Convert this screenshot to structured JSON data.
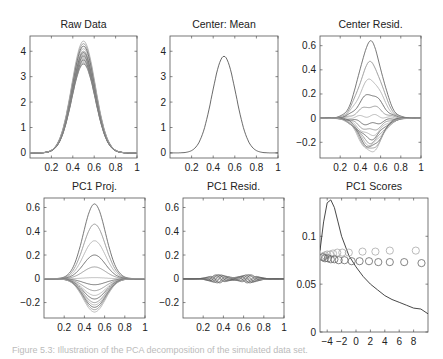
{
  "figure": {
    "caption": "Figure 5.3: Illustration of the PCA decomposition of the simulated data set."
  },
  "chart_data": [
    {
      "type": "line",
      "title": "Raw Data",
      "panel": "top-left",
      "xlim": [
        0,
        1
      ],
      "ylim": [
        -0.2,
        4.6
      ],
      "xticks": [
        "0.2",
        "0.4",
        "0.6",
        "0.8",
        "1"
      ],
      "yticks": [
        "0",
        "1",
        "2",
        "3",
        "4"
      ],
      "description": "Family of Gaussian-shaped curves centered at x=0.5, peak heights ranging roughly 3.5 to 4.4",
      "series": {
        "center": 0.5,
        "width": 0.11,
        "peaks": [
          3.5,
          3.55,
          3.6,
          3.65,
          3.7,
          3.75,
          3.8,
          3.85,
          3.9,
          3.95,
          4.0,
          4.1,
          4.2,
          4.3,
          4.4
        ]
      }
    },
    {
      "type": "line",
      "title": "Center: Mean",
      "panel": "top-middle",
      "xlim": [
        0,
        1
      ],
      "ylim": [
        -0.2,
        4.6
      ],
      "xticks": [
        "0.2",
        "0.4",
        "0.6",
        "0.8",
        "1"
      ],
      "yticks": [
        "0",
        "1",
        "2",
        "3",
        "4"
      ],
      "description": "Single mean curve, Gaussian centered at 0.5, peak ~3.8",
      "series": {
        "center": 0.5,
        "width": 0.11,
        "peaks": [
          3.8
        ]
      }
    },
    {
      "type": "line",
      "title": "Center Resid.",
      "panel": "top-right",
      "xlim": [
        0,
        1
      ],
      "ylim": [
        -0.33,
        0.68
      ],
      "xticks": [
        "0.2",
        "0.4",
        "0.6",
        "0.8",
        "1"
      ],
      "yticks": [
        "0.6",
        "0.4",
        "0.2",
        "0",
        "-0.2"
      ],
      "description": "Residuals after mean-centering; bumps with amplitudes from -0.28 to 0.63, slightly noisy",
      "series": {
        "center": 0.5,
        "width": 0.11,
        "peaks": [
          0.63,
          0.46,
          0.32,
          0.2,
          0.1,
          0.02,
          -0.05,
          -0.1,
          -0.14,
          -0.17,
          -0.2,
          -0.22,
          -0.24,
          -0.26,
          -0.28
        ]
      }
    },
    {
      "type": "line",
      "title": "PC1 Proj.",
      "panel": "bottom-left",
      "xlim": [
        0,
        1
      ],
      "ylim": [
        -0.33,
        0.68
      ],
      "xticks": [
        "0.2",
        "0.4",
        "0.6",
        "0.8",
        "1"
      ],
      "yticks": [
        "0.6",
        "0.4",
        "0.2",
        "0",
        "-0.2"
      ],
      "description": "Projections onto first principal component; smooth scaled Gaussian bumps",
      "series": {
        "center": 0.5,
        "width": 0.11,
        "peaks": [
          0.63,
          0.46,
          0.32,
          0.2,
          0.1,
          0.01,
          -0.05,
          -0.1,
          -0.14,
          -0.17,
          -0.2,
          -0.22,
          -0.24,
          -0.26,
          -0.28
        ]
      }
    },
    {
      "type": "line",
      "title": "PC1 Resid.",
      "panel": "bottom-middle",
      "xlim": [
        0,
        1
      ],
      "ylim": [
        -0.33,
        0.68
      ],
      "xticks": [
        "0.2",
        "0.4",
        "0.6",
        "0.8",
        "1"
      ],
      "yticks": [
        "0.6",
        "0.4",
        "0.2",
        "0",
        "-0.2"
      ],
      "description": "Small residual wiggles near 0, amplitude about ±0.04, over x in [0.2, 0.8]"
    },
    {
      "type": "scatter",
      "title": "PC1 Scores",
      "panel": "bottom-right",
      "xlim": [
        -5,
        10
      ],
      "ylim": [
        0,
        0.14
      ],
      "xticks": [
        "-4",
        "-2",
        "0",
        "2",
        "4",
        "6",
        "8"
      ],
      "yticks": [
        "0.1",
        "0.05",
        "0"
      ],
      "description": "Density curve of PC1 scores with circles marking individual scores at two levels",
      "density_curve": {
        "x": [
          -5,
          -4.5,
          -4,
          -3.5,
          -3,
          -2.5,
          -2,
          -1,
          0,
          1,
          2,
          3,
          4,
          5,
          6,
          7,
          8,
          9,
          10
        ],
        "y": [
          0.085,
          0.115,
          0.135,
          0.138,
          0.13,
          0.115,
          0.1,
          0.08,
          0.068,
          0.058,
          0.05,
          0.044,
          0.038,
          0.034,
          0.031,
          0.028,
          0.025,
          0.024,
          0.019
        ]
      },
      "circles_upper": {
        "x": [
          -4.6,
          -4.3,
          -4.0,
          -3.6,
          -3.2,
          -2.6,
          -1.9,
          -1.0,
          0.9,
          2.7,
          4.7,
          8.3
        ],
        "y": [
          0.079,
          0.08,
          0.081,
          0.081,
          0.082,
          0.083,
          0.083,
          0.083,
          0.084,
          0.084,
          0.085,
          0.085
        ]
      },
      "circles_lower": {
        "x": [
          -4.6,
          -4.3,
          -3.9,
          -3.5,
          -3.0,
          -2.4,
          -1.6,
          -0.6,
          0.5,
          1.8,
          3.1,
          4.7,
          6.7,
          9.1
        ],
        "y": [
          0.078,
          0.077,
          0.077,
          0.076,
          0.076,
          0.075,
          0.075,
          0.074,
          0.074,
          0.074,
          0.073,
          0.073,
          0.073,
          0.072
        ]
      }
    }
  ]
}
